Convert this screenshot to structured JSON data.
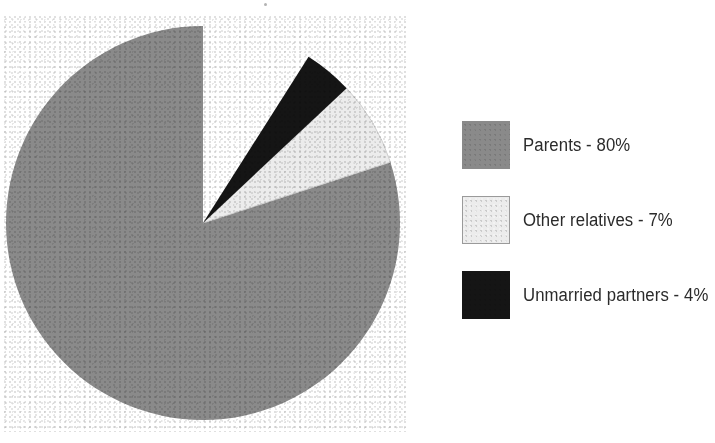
{
  "figure": {
    "title": "",
    "background_color": "#ffffff"
  },
  "chart_data": {
    "type": "pie",
    "title": "",
    "xlabel": "",
    "ylabel": "",
    "categories": [
      "Parents",
      "Other relatives",
      "Unmarried partners"
    ],
    "values": [
      80,
      7,
      4
    ],
    "value_unit": "%",
    "slice_labels": [
      "Parents - 80%",
      "Other relatives - 7%",
      "Unmarried partners - 4%"
    ],
    "colors": [
      "#8a8a8a",
      "#ececec",
      "#151515"
    ],
    "start_angle_deg": 0,
    "direction": "counterclockwise",
    "legend_position": "right",
    "grid": false
  },
  "legend": {
    "items": [
      {
        "label": "Parents - 80%",
        "swatch_name": "gray-swatch",
        "color": "#8a8a8a",
        "border": "none"
      },
      {
        "label": "Other relatives - 7%",
        "swatch_name": "light-swatch",
        "color": "#ececec",
        "border": "#9a9a9a"
      },
      {
        "label": "Unmarried partners - 4%",
        "swatch_name": "black-swatch",
        "color": "#151515",
        "border": "none"
      }
    ]
  },
  "pie": {
    "center_x": 200,
    "center_y": 209,
    "radius": 197,
    "slices": [
      {
        "name": "parents-slice",
        "label": "Parents",
        "percent": 80,
        "color": "#8a8a8a"
      },
      {
        "name": "other-relatives-slice",
        "label": "Other relatives",
        "percent": 7,
        "color": "#ececec"
      },
      {
        "name": "unmarried-partners-slice",
        "label": "Unmarried partners",
        "percent": 4,
        "color": "#151515"
      }
    ]
  }
}
